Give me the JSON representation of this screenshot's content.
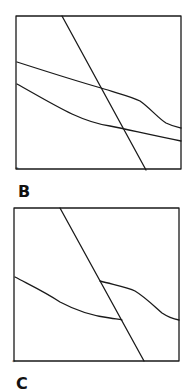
{
  "panels": [
    {
      "label": "B",
      "frame": {
        "x1": 16,
        "y1": 16,
        "x2": 181,
        "y2": 169
      },
      "curves": [
        {
          "name": "steep-line",
          "path": "M62 16 L146 170"
        },
        {
          "name": "upper-curve",
          "path": "M17 62 C45 71, 80 82, 101 88 C120 94, 133 97, 140 101 C150 108, 158 118, 166 123 C172 126, 177 127, 181 128"
        },
        {
          "name": "lower-curve",
          "path": "M17 84 C35 94, 55 106, 72 114 C85 120, 96 124, 110 126 C130 130, 155 136, 181 141"
        }
      ]
    },
    {
      "label": "C",
      "frame": {
        "x1": 14,
        "y1": 208,
        "x2": 179,
        "y2": 361
      },
      "curves": [
        {
          "name": "steep-line",
          "path": "M60 208 L144 361"
        },
        {
          "name": "upper-curve",
          "path": "M100 281 C115 285, 128 287, 135 291 C145 297, 155 307, 162 313 C168 317, 174 319, 179 320"
        },
        {
          "name": "lower-curve",
          "path": "M15 277 C30 285, 45 292, 60 302 C75 310, 92 316, 110 318 C115 319, 119 319, 122 320"
        }
      ]
    }
  ],
  "colors": {
    "line": "#1a1a1a",
    "background": "#ffffff"
  }
}
